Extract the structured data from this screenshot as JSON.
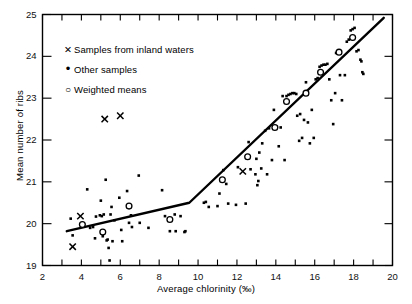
{
  "figure": {
    "background": "#ffffff",
    "ink": "#000000",
    "width": 412,
    "height": 304
  },
  "axes": {
    "x_title": "Average chlorinity (‰)",
    "y_title": "Mean number of ribs",
    "x_ticklabels": [
      "2",
      "4",
      "6",
      "8",
      "10",
      "12",
      "14",
      "16",
      "18",
      "20"
    ],
    "y_ticklabels": [
      "19",
      "20",
      "21",
      "22",
      "23",
      "24",
      "25"
    ]
  },
  "legend": {
    "items": [
      {
        "marker": "cross",
        "label": "Samples from inland waters"
      },
      {
        "marker": "dot",
        "label": "Other samples"
      },
      {
        "marker": "circle",
        "label": "Weighted means"
      }
    ]
  },
  "chart_data": {
    "type": "scatter",
    "title": "",
    "xlabel": "Average chlorinity (‰)",
    "ylabel": "Mean number of ribs",
    "xlim": [
      2,
      20
    ],
    "ylim": [
      19,
      25
    ],
    "xticks": [
      2,
      3,
      4,
      5,
      6,
      7,
      8,
      9,
      10,
      11,
      12,
      13,
      14,
      15,
      16,
      17,
      18,
      19,
      20
    ],
    "xtick_labeled": [
      2,
      4,
      6,
      8,
      10,
      12,
      14,
      16,
      18,
      20
    ],
    "yticks": [
      19,
      20,
      21,
      22,
      23,
      24,
      25
    ],
    "grid": false,
    "legend_position": "upper-left-inside",
    "series": [
      {
        "name": "Samples from inland waters",
        "marker": "cross",
        "points": [
          [
            3.55,
            19.45
          ],
          [
            3.95,
            20.18
          ],
          [
            5.2,
            22.5
          ],
          [
            6.0,
            22.58
          ],
          [
            12.3,
            21.25
          ]
        ]
      },
      {
        "name": "Weighted means",
        "marker": "circle",
        "points": [
          [
            4.05,
            19.98
          ],
          [
            5.1,
            19.8
          ],
          [
            6.45,
            20.42
          ],
          [
            8.55,
            20.1
          ],
          [
            11.25,
            21.05
          ],
          [
            12.55,
            21.6
          ],
          [
            13.95,
            22.3
          ],
          [
            14.55,
            22.92
          ],
          [
            15.55,
            23.12
          ],
          [
            16.3,
            23.62
          ],
          [
            17.25,
            24.1
          ],
          [
            17.95,
            24.45
          ]
        ]
      },
      {
        "name": "Other samples",
        "marker": "dot",
        "points": [
          [
            3.45,
            20.12
          ],
          [
            3.55,
            19.72
          ],
          [
            4.3,
            20.82
          ],
          [
            4.45,
            19.9
          ],
          [
            4.6,
            19.92
          ],
          [
            4.7,
            19.65
          ],
          [
            4.75,
            20.17
          ],
          [
            4.95,
            20.2
          ],
          [
            5.0,
            20.55
          ],
          [
            5.05,
            20.18
          ],
          [
            5.1,
            19.7
          ],
          [
            5.15,
            20.22
          ],
          [
            5.25,
            21.05
          ],
          [
            5.3,
            19.6
          ],
          [
            5.35,
            19.62
          ],
          [
            5.4,
            19.42
          ],
          [
            5.45,
            19.12
          ],
          [
            5.5,
            20.22
          ],
          [
            5.55,
            20.4
          ],
          [
            5.6,
            19.58
          ],
          [
            5.7,
            20.08
          ],
          [
            5.95,
            20.62
          ],
          [
            6.05,
            19.85
          ],
          [
            6.1,
            19.58
          ],
          [
            6.35,
            20.78
          ],
          [
            6.45,
            20.02
          ],
          [
            6.55,
            20.2
          ],
          [
            6.6,
            19.92
          ],
          [
            6.95,
            21.15
          ],
          [
            7.0,
            20.02
          ],
          [
            7.45,
            19.9
          ],
          [
            8.15,
            20.8
          ],
          [
            8.3,
            20.18
          ],
          [
            8.55,
            19.82
          ],
          [
            8.8,
            20.22
          ],
          [
            8.85,
            19.82
          ],
          [
            9.1,
            20.18
          ],
          [
            9.3,
            19.8
          ],
          [
            9.35,
            19.82
          ],
          [
            10.3,
            20.5
          ],
          [
            10.4,
            20.52
          ],
          [
            10.55,
            20.4
          ],
          [
            11.0,
            20.42
          ],
          [
            11.1,
            20.72
          ],
          [
            11.3,
            21.28
          ],
          [
            11.45,
            20.95
          ],
          [
            11.55,
            20.48
          ],
          [
            11.95,
            20.45
          ],
          [
            12.05,
            21.35
          ],
          [
            12.45,
            20.48
          ],
          [
            12.55,
            21.62
          ],
          [
            12.6,
            21.95
          ],
          [
            12.7,
            21.3
          ],
          [
            12.95,
            21.18
          ],
          [
            13.0,
            21.55
          ],
          [
            13.05,
            20.92
          ],
          [
            13.1,
            21.02
          ],
          [
            13.15,
            21.7
          ],
          [
            13.25,
            21.32
          ],
          [
            13.3,
            21.92
          ],
          [
            13.45,
            22.22
          ],
          [
            13.55,
            21.18
          ],
          [
            13.65,
            22.28
          ],
          [
            13.8,
            21.52
          ],
          [
            13.9,
            22.72
          ],
          [
            14.05,
            22.32
          ],
          [
            14.15,
            21.85
          ],
          [
            14.25,
            22.3
          ],
          [
            14.35,
            23.05
          ],
          [
            14.45,
            21.52
          ],
          [
            14.55,
            23.05
          ],
          [
            14.65,
            23.08
          ],
          [
            14.75,
            23.1
          ],
          [
            14.85,
            23.12
          ],
          [
            14.95,
            23.12
          ],
          [
            15.05,
            23.1
          ],
          [
            15.1,
            22.58
          ],
          [
            15.2,
            21.98
          ],
          [
            15.25,
            22.62
          ],
          [
            15.35,
            22.05
          ],
          [
            15.45,
            22.48
          ],
          [
            15.55,
            23.38
          ],
          [
            15.65,
            22.42
          ],
          [
            15.75,
            21.92
          ],
          [
            15.85,
            22.72
          ],
          [
            15.95,
            22.05
          ],
          [
            16.05,
            23.45
          ],
          [
            16.15,
            23.48
          ],
          [
            16.25,
            23.75
          ],
          [
            16.35,
            23.78
          ],
          [
            16.45,
            23.8
          ],
          [
            16.55,
            23.8
          ],
          [
            16.65,
            23.82
          ],
          [
            16.75,
            23.45
          ],
          [
            16.85,
            22.95
          ],
          [
            16.95,
            22.38
          ],
          [
            17.05,
            23.12
          ],
          [
            17.1,
            24.08
          ],
          [
            17.2,
            24.12
          ],
          [
            17.3,
            23.55
          ],
          [
            17.4,
            22.95
          ],
          [
            17.55,
            23.55
          ],
          [
            17.65,
            24.35
          ],
          [
            17.75,
            24.4
          ],
          [
            17.85,
            24.62
          ],
          [
            17.95,
            24.65
          ],
          [
            18.05,
            24.68
          ],
          [
            18.15,
            24.12
          ],
          [
            18.25,
            24.15
          ],
          [
            18.35,
            23.92
          ],
          [
            18.4,
            23.88
          ],
          [
            18.45,
            23.62
          ],
          [
            18.5,
            23.58
          ]
        ]
      }
    ],
    "fit_line": {
      "name": "fitted piecewise regression",
      "vertices": [
        [
          3.25,
          19.82
        ],
        [
          9.55,
          20.5
        ],
        [
          19.55,
          24.92
        ]
      ]
    }
  }
}
